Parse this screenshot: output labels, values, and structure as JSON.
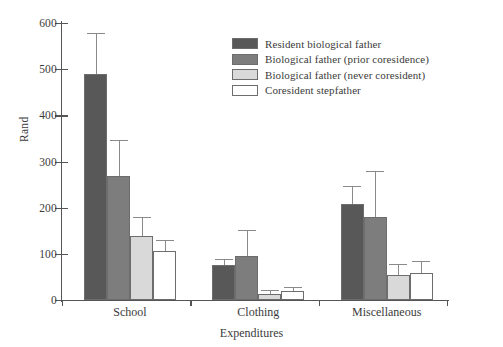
{
  "chart_data": {
    "type": "bar",
    "title": "",
    "subtitle": "",
    "xlabel": "Expenditures",
    "ylabel": "Rand",
    "categories": [
      "School",
      "Clothing",
      "Miscellaneous"
    ],
    "ylim": [
      0,
      600
    ],
    "yticks": [
      0,
      100,
      200,
      300,
      400,
      500,
      600
    ],
    "ytick_labels": [
      "0",
      "100",
      "200",
      "300",
      "400",
      "500",
      "600"
    ],
    "grid": false,
    "legend_position": "upper center",
    "error_bars": "standard error (upper only)",
    "series": [
      {
        "name": "Resident biological father",
        "color": "#585858",
        "values": [
          490,
          75,
          208
        ],
        "errors_upper": [
          578,
          88,
          247
        ]
      },
      {
        "name": "Biological father (prior coresidence)",
        "color": "#7d7d7d",
        "values": [
          268,
          95,
          180
        ],
        "errors_upper": [
          346,
          151,
          279
        ]
      },
      {
        "name": "Biological father (never coresident)",
        "color": "#d9d9d9",
        "values": [
          138,
          13,
          55
        ],
        "errors_upper": [
          180,
          22,
          78
        ]
      },
      {
        "name": "Coresident stepfather",
        "color": "#ffffff",
        "values": [
          106,
          19,
          58
        ],
        "errors_upper": [
          131,
          28,
          84
        ]
      }
    ]
  },
  "legend": {
    "items": [
      {
        "label": "Resident biological father",
        "color": "#585858"
      },
      {
        "label": "Biological father (prior coresidence)",
        "color": "#7d7d7d"
      },
      {
        "label": "Biological father (never coresident)",
        "color": "#d9d9d9"
      },
      {
        "label": "Coresident stepfather",
        "color": "#ffffff"
      }
    ]
  },
  "colors": {
    "axis": "#555555",
    "text": "#3b3b3b",
    "bar_edge": "#6d6d6d",
    "error_bar": "#8a8a8a",
    "background": "#ffffff"
  }
}
